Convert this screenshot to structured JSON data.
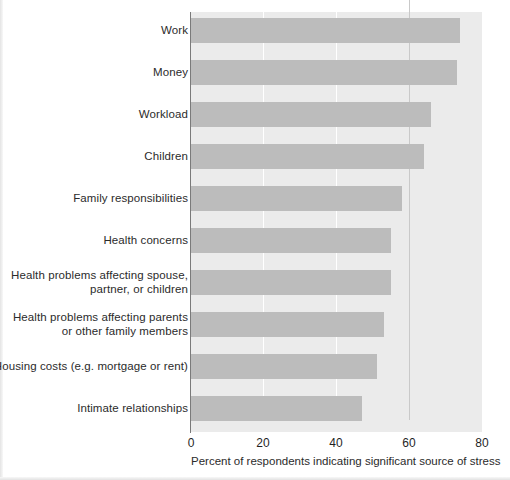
{
  "chart_data": {
    "type": "bar",
    "orientation": "horizontal",
    "title": "",
    "subtitle": "",
    "xlabel": "Percent of respondents indicating significant source of stress",
    "ylabel": "",
    "xlim": [
      0,
      80
    ],
    "xticks": [
      0,
      20,
      40,
      60,
      80
    ],
    "xtick_labels": [
      "0",
      "20",
      "40",
      "60",
      "80"
    ],
    "grid": true,
    "legend": false,
    "legend_position": "none",
    "categories": [
      "Work",
      "Money",
      "Workload",
      "Children",
      "Family responsibilities",
      "Health concerns",
      "Health problems affecting spouse, partner, or children",
      "Health problems affecting parents or other family members",
      "Housing costs (e.g. mortgage or rent)",
      "Intimate relationships"
    ],
    "category_lines": [
      [
        "Work"
      ],
      [
        "Money"
      ],
      [
        "Workload"
      ],
      [
        "Children"
      ],
      [
        "Family responsibilities"
      ],
      [
        "Health concerns"
      ],
      [
        "Health problems affecting spouse,",
        "partner, or children"
      ],
      [
        "Health problems affecting parents",
        "or other family members"
      ],
      [
        "Housing costs (e.g. mortgage or rent)"
      ],
      [
        "Intimate relationships"
      ]
    ],
    "values": [
      74,
      73,
      66,
      64,
      58,
      55,
      55,
      53,
      51,
      47
    ],
    "colors": {
      "bar": "#bcbcbc",
      "plot_background": "#ebebeb",
      "gridline": "#ffffff",
      "gridline_major": "#c9c9c9",
      "axis": "#7a7a7a",
      "text": "#2b2b2b",
      "page_background": "#ffffff"
    }
  },
  "axis": {
    "tick_0": "0",
    "tick_20": "20",
    "tick_40": "40",
    "tick_60": "60",
    "tick_80": "80",
    "caption": "Percent of respondents indicating significant source of stress"
  },
  "labels": {
    "work": "Work",
    "money": "Money",
    "workload": "Workload",
    "children": "Children",
    "family_responsibilities": "Family responsibilities",
    "health_concerns": "Health concerns",
    "health_problems_spouse_line1": "Health problems affecting spouse,",
    "health_problems_spouse_line2": "partner, or children",
    "health_problems_parents_line1": "Health problems affecting parents",
    "health_problems_parents_line2": "or other family members",
    "housing_costs": "Housing costs (e.g. mortgage or rent)",
    "intimate_relationships": "Intimate relationships"
  }
}
